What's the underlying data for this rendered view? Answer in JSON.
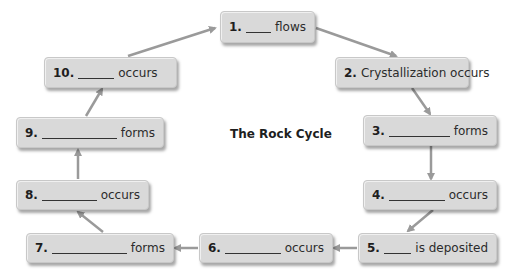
{
  "diagram": {
    "title": "The Rock Cycle",
    "arrow_color": "#9a9a9a",
    "box_color": "#d9d9d9",
    "steps": [
      {
        "num": "1.",
        "blank": true,
        "text": "flows"
      },
      {
        "num": "2.",
        "blank": false,
        "text": "Crystallization occurs"
      },
      {
        "num": "3.",
        "blank": true,
        "text": "forms"
      },
      {
        "num": "4.",
        "blank": true,
        "text": "occurs"
      },
      {
        "num": "5.",
        "blank": true,
        "text": "is deposited"
      },
      {
        "num": "6.",
        "blank": true,
        "text": "occurs"
      },
      {
        "num": "7.",
        "blank": true,
        "text": "forms"
      },
      {
        "num": "8.",
        "blank": true,
        "text": "occurs"
      },
      {
        "num": "9.",
        "blank": true,
        "text": "forms"
      },
      {
        "num": "10.",
        "blank": true,
        "text": "occurs"
      }
    ]
  }
}
